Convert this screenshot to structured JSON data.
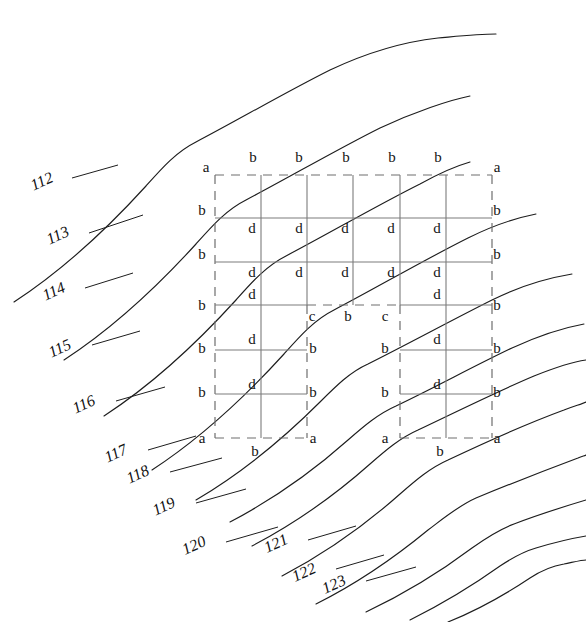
{
  "figure": {
    "type": "patent-technical-drawing",
    "width": 586,
    "height": 622,
    "background_color": "#ffffff",
    "line_color": "#1d1d1d",
    "grid_solid_color": "#7c7c7c",
    "grid_dashed_color": "#6e6e6e"
  },
  "reference_numerals": [
    {
      "id": "ref-112",
      "text": "112",
      "x": 44,
      "y": 186,
      "leader": [
        [
          72,
          178
        ],
        [
          118,
          165
        ]
      ]
    },
    {
      "id": "ref-113",
      "text": "113",
      "x": 60,
      "y": 240,
      "leader": [
        [
          89,
          233
        ],
        [
          143,
          215
        ]
      ]
    },
    {
      "id": "ref-114",
      "text": "114",
      "x": 56,
      "y": 296,
      "leader": [
        [
          85,
          288
        ],
        [
          133,
          273
        ]
      ]
    },
    {
      "id": "ref-115",
      "text": "115",
      "x": 62,
      "y": 353,
      "leader": [
        [
          92,
          345
        ],
        [
          140,
          331
        ]
      ]
    },
    {
      "id": "ref-116",
      "text": "116",
      "x": 86,
      "y": 409,
      "leader": [
        [
          116,
          401
        ],
        [
          165,
          387
        ]
      ]
    },
    {
      "id": "ref-117",
      "text": "117",
      "x": 118,
      "y": 458,
      "leader": [
        [
          148,
          450
        ],
        [
          196,
          436
        ]
      ]
    },
    {
      "id": "ref-118",
      "text": "118",
      "x": 140,
      "y": 479,
      "leader": [
        [
          170,
          472
        ],
        [
          222,
          458
        ]
      ]
    },
    {
      "id": "ref-119",
      "text": "119",
      "x": 166,
      "y": 511,
      "leader": [
        [
          196,
          503
        ],
        [
          246,
          489
        ]
      ]
    },
    {
      "id": "ref-120",
      "text": "120",
      "x": 196,
      "y": 550,
      "leader": [
        [
          226,
          542
        ],
        [
          278,
          527
        ]
      ]
    },
    {
      "id": "ref-121",
      "text": "121",
      "x": 278,
      "y": 548,
      "leader": [
        [
          308,
          540
        ],
        [
          356,
          526
        ]
      ]
    },
    {
      "id": "ref-122",
      "text": "122",
      "x": 306,
      "y": 577,
      "leader": [
        [
          336,
          569
        ],
        [
          384,
          555
        ]
      ]
    },
    {
      "id": "ref-123",
      "text": "123",
      "x": 336,
      "y": 589,
      "leader": [
        [
          366,
          581
        ],
        [
          416,
          567
        ]
      ]
    }
  ],
  "grid": {
    "left": 215,
    "right": 492,
    "top": 175,
    "bottom": 438,
    "middle_y": 305,
    "columns_x": [
      215,
      261,
      307,
      353,
      400,
      446,
      492
    ],
    "rows_y": [
      175,
      218,
      262,
      305,
      350,
      394,
      438
    ],
    "sub_grid_left": {
      "x0": 215,
      "x1": 307
    },
    "sub_grid_right": {
      "x0": 400,
      "x1": 492
    }
  },
  "node_labels": {
    "top_row": [
      {
        "text": "a",
        "x": 206,
        "y": 172
      },
      {
        "text": "b",
        "x": 253,
        "y": 162
      },
      {
        "text": "b",
        "x": 299,
        "y": 162
      },
      {
        "text": "b",
        "x": 346,
        "y": 162
      },
      {
        "text": "b",
        "x": 392,
        "y": 162
      },
      {
        "text": "b",
        "x": 438,
        "y": 162
      },
      {
        "text": "a",
        "x": 497,
        "y": 172
      }
    ],
    "left_edge": [
      {
        "text": "b",
        "x": 202,
        "y": 215
      },
      {
        "text": "b",
        "x": 202,
        "y": 259
      },
      {
        "text": "b",
        "x": 202,
        "y": 310
      },
      {
        "text": "b",
        "x": 202,
        "y": 353
      },
      {
        "text": "b",
        "x": 202,
        "y": 397
      },
      {
        "text": "a",
        "x": 202,
        "y": 443
      }
    ],
    "right_edge": [
      {
        "text": "b",
        "x": 497,
        "y": 215
      },
      {
        "text": "b",
        "x": 497,
        "y": 259
      },
      {
        "text": "b",
        "x": 497,
        "y": 310
      },
      {
        "text": "b",
        "x": 497,
        "y": 353
      },
      {
        "text": "b",
        "x": 497,
        "y": 397
      },
      {
        "text": "a",
        "x": 497,
        "y": 443
      }
    ],
    "interior_upper": [
      {
        "text": "d",
        "x": 252,
        "y": 233
      },
      {
        "text": "d",
        "x": 299,
        "y": 233
      },
      {
        "text": "d",
        "x": 345,
        "y": 233
      },
      {
        "text": "d",
        "x": 391,
        "y": 233
      },
      {
        "text": "d",
        "x": 437,
        "y": 233
      },
      {
        "text": "d",
        "x": 252,
        "y": 277
      },
      {
        "text": "d",
        "x": 299,
        "y": 277
      },
      {
        "text": "d",
        "x": 345,
        "y": 277
      },
      {
        "text": "d",
        "x": 391,
        "y": 277
      },
      {
        "text": "d",
        "x": 437,
        "y": 277
      },
      {
        "text": "d",
        "x": 252,
        "y": 299
      },
      {
        "text": "d",
        "x": 437,
        "y": 299
      }
    ],
    "middle_divider": [
      {
        "text": "c",
        "x": 312,
        "y": 321
      },
      {
        "text": "b",
        "x": 348,
        "y": 321
      },
      {
        "text": "c",
        "x": 385,
        "y": 321
      }
    ],
    "interior_lower": [
      {
        "text": "d",
        "x": 252,
        "y": 344
      },
      {
        "text": "d",
        "x": 437,
        "y": 344
      },
      {
        "text": "d",
        "x": 252,
        "y": 389
      },
      {
        "text": "d",
        "x": 437,
        "y": 389
      }
    ],
    "sub_grid_inner_edges": [
      {
        "text": "b",
        "x": 313,
        "y": 353
      },
      {
        "text": "b",
        "x": 313,
        "y": 397
      },
      {
        "text": "a",
        "x": 313,
        "y": 443
      },
      {
        "text": "b",
        "x": 385,
        "y": 353
      },
      {
        "text": "b",
        "x": 385,
        "y": 397
      },
      {
        "text": "a",
        "x": 385,
        "y": 443
      }
    ],
    "bottom_row": [
      {
        "text": "b",
        "x": 255,
        "y": 456
      },
      {
        "text": "b",
        "x": 440,
        "y": 456
      }
    ]
  },
  "wave_curves": [
    {
      "id": "wave-112",
      "d": "M 14 302 C 60 272 106 230 146 186 C 162 168 176 152 196 142 C 238 120 286 92 330 70 C 364 54 402 42 438 38 C 460 36 478 34 496 34"
    },
    {
      "id": "wave-113",
      "d": "M 64 360 C 110 330 156 288 196 244 C 212 226 226 210 246 200 C 288 178 336 150 380 128 C 414 112 450 100 470 96"
    },
    {
      "id": "wave-114",
      "d": "M 104 416 C 150 386 196 344 236 300 C 252 282 266 266 286 256 C 328 234 376 206 420 184 C 438 174 456 166 470 162"
    },
    {
      "id": "wave-115",
      "d": "M 152 470 C 198 440 244 398 284 354 C 300 336 314 320 334 310 C 376 288 424 260 468 238 C 492 226 516 218 536 214"
    },
    {
      "id": "wave-116",
      "d": "M 196 500 C 240 474 282 440 320 402 C 336 386 350 372 368 364 C 408 344 452 320 492 300 C 520 286 548 278 572 274"
    },
    {
      "id": "wave-117",
      "d": "M 230 522 C 272 500 312 472 348 440 C 364 426 378 414 396 406 C 434 388 474 366 512 348 C 538 336 562 328 584 324"
    },
    {
      "id": "wave-118",
      "d": "M 252 546 C 294 524 334 496 370 464 C 386 450 400 438 418 430 C 456 412 496 392 534 376 C 554 368 572 362 586 360"
    },
    {
      "id": "wave-119",
      "d": "M 282 576 C 324 554 364 526 400 494 C 416 480 430 468 448 460 C 486 442 526 424 564 410 C 574 406 582 404 586 402"
    },
    {
      "id": "wave-120",
      "d": "M 316 604 C 356 584 394 558 428 530 C 444 518 458 506 476 498 C 510 484 546 470 578 458 C 582 456 584 456 586 455"
    },
    {
      "id": "wave-121",
      "d": "M 366 612 C 404 594 440 572 472 548 C 486 538 498 530 514 524 C 540 514 566 506 586 500"
    },
    {
      "id": "wave-122",
      "d": "M 410 620 C 442 604 472 586 500 566 C 512 558 522 552 536 548 C 556 542 574 538 586 536"
    },
    {
      "id": "wave-123",
      "d": "M 448 622 C 478 610 506 594 530 578 C 542 570 552 566 564 564 C 574 562 582 560 586 560"
    }
  ]
}
